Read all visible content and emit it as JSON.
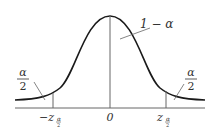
{
  "diagram": {
    "type": "normal-distribution-critical-region",
    "center_label": "0",
    "left_critical_label": "−z",
    "right_critical_label": "z",
    "subscript_numerator": "α",
    "subscript_denominator": "2",
    "center_region_label": "1 − α",
    "left_tail_label": {
      "numerator": "α",
      "denominator": "2"
    },
    "right_tail_label": {
      "numerator": "α",
      "denominator": "2"
    },
    "colors": {
      "curve": "#1a1a1a",
      "lines": "#555555",
      "text": "#333333"
    }
  }
}
